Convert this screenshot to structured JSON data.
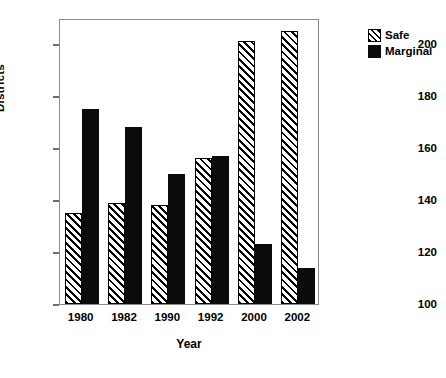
{
  "chart_data": {
    "type": "bar",
    "title": "",
    "xlabel": "Year",
    "ylabel": "Districts",
    "categories": [
      "1980",
      "1982",
      "1990",
      "1992",
      "2000",
      "2002"
    ],
    "series": [
      {
        "name": "Safe",
        "values": [
          135,
          139,
          138,
          156,
          201,
          205
        ]
      },
      {
        "name": "Marginal",
        "values": [
          175,
          168,
          150,
          157,
          123,
          114
        ]
      }
    ],
    "ylim": [
      100,
      210
    ],
    "yticks": [
      100,
      120,
      140,
      160,
      180,
      200
    ],
    "ytick_labels": [
      "100",
      "120",
      "140",
      "160",
      "180",
      "200"
    ],
    "grid": false,
    "legend_position": "right-top",
    "legend_entries": [
      "Safe",
      "Marginal"
    ]
  },
  "style": {
    "safe_color": "#ffffff",
    "safe_hatch_color": "#000000",
    "marginal_color": "#0b0b0b",
    "frame_color": "#8a8a8a",
    "text_color": "#000000"
  }
}
